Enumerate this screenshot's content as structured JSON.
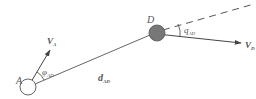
{
  "diagram": {
    "labels": {
      "point_a": "A",
      "point_d": "D",
      "velocity_a": "V",
      "velocity_a_sub": "A",
      "velocity_d": "V",
      "velocity_d_sub": "D",
      "distance": "d",
      "distance_sub": "AD",
      "angle_phi": "φ",
      "angle_phi_sub": "AD",
      "angle_q": "q",
      "angle_q_sub": "AD"
    },
    "colors": {
      "line": "#555555",
      "target_fill": "#777777",
      "text": "#555555"
    }
  }
}
